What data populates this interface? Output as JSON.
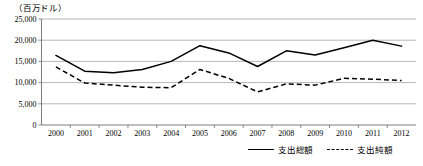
{
  "figure": {
    "unit_label": "（百万ドル）"
  },
  "legend": {
    "position": "bottom-right",
    "entries": [
      {
        "label": "支出総額",
        "style": "solid"
      },
      {
        "label": "支出純額",
        "style": "dashed"
      }
    ]
  },
  "chart_data": {
    "type": "line",
    "title": "",
    "subtitle": "",
    "xlabel": "",
    "ylabel": "（百万ドル）",
    "x": [
      "2000",
      "2001",
      "2002",
      "2003",
      "2004",
      "2005",
      "2006",
      "2007",
      "2008",
      "2009",
      "2010",
      "2011",
      "2012"
    ],
    "categories": [
      "2000",
      "2001",
      "2002",
      "2003",
      "2004",
      "2005",
      "2006",
      "2007",
      "2008",
      "2009",
      "2010",
      "2011",
      "2012"
    ],
    "ylim": [
      0,
      25000
    ],
    "yticks": [
      0,
      5000,
      10000,
      15000,
      20000,
      25000
    ],
    "ytick_labels": [
      "0",
      "5,000",
      "10,000",
      "15,000",
      "20,000",
      "25,000"
    ],
    "grid": true,
    "grid_axis": "y",
    "legend_position": "bottom-right",
    "series": [
      {
        "name": "支出総額",
        "style": "solid",
        "color": "#000000",
        "values": [
          16400,
          12700,
          12300,
          13100,
          15000,
          18700,
          17000,
          13800,
          17500,
          16500,
          18200,
          20000,
          18600
        ]
      },
      {
        "name": "支出純額",
        "style": "dashed",
        "color": "#000000",
        "values": [
          13700,
          9900,
          9400,
          8900,
          8800,
          13100,
          11000,
          7800,
          9700,
          9400,
          11000,
          10800,
          10500
        ]
      }
    ]
  }
}
